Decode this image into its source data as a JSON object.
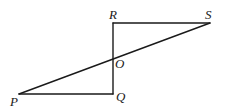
{
  "diagram": {
    "type": "geometry",
    "points": {
      "P": {
        "label": "P",
        "x": 19,
        "y": 94
      },
      "Q": {
        "label": "Q",
        "x": 113,
        "y": 94
      },
      "R": {
        "label": "R",
        "x": 113,
        "y": 23
      },
      "S": {
        "label": "S",
        "x": 210,
        "y": 23
      },
      "O": {
        "label": "O",
        "x": 113,
        "y": 59
      }
    },
    "segments": [
      {
        "name": "RS",
        "from": "R",
        "to": "S"
      },
      {
        "name": "RQ",
        "from": "R",
        "to": "Q"
      },
      {
        "name": "PQ",
        "from": "P",
        "to": "Q"
      },
      {
        "name": "PS",
        "from": "P",
        "to": "S"
      }
    ],
    "labels": {
      "P": "P",
      "Q": "Q",
      "R": "R",
      "S": "S",
      "O": "O"
    }
  }
}
